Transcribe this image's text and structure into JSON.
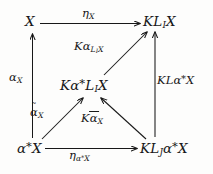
{
  "figure": {
    "kind": "commutative-diagram",
    "background_color": "#fdfdfc",
    "ink_color": "#181818"
  },
  "nodes": {
    "top_left": {
      "id": "X",
      "parts": [
        "X"
      ]
    },
    "top_right": {
      "id": "KL_I X",
      "parts": [
        "K",
        "L",
        "I",
        "X"
      ]
    },
    "center": {
      "id": "Ka*L_I X",
      "parts": [
        "K",
        "a",
        "*",
        "L",
        "I",
        "X"
      ]
    },
    "bottom_left": {
      "id": "a*X",
      "parts": [
        "a",
        "*",
        "X"
      ]
    },
    "bottom_right": {
      "id": "KL_J a*X",
      "parts": [
        "K",
        "L",
        "J",
        "a",
        "*",
        "X"
      ]
    }
  },
  "edge_labels": {
    "eta_x": {
      "base": "η",
      "sub": "X"
    },
    "k_alpha_lix": {
      "base": "Kα",
      "sub": "L",
      "subsub": "I",
      "subtail": "X"
    },
    "kl_alpha_x": {
      "base": "KLα",
      "star": "*",
      "tail": "X"
    },
    "alpha_x": {
      "base": "α",
      "sub": "X"
    },
    "alpha_tilde_x": {
      "base": "α",
      "accent": "~",
      "sub": "X"
    },
    "k_alpha_bar_x": {
      "base": "Kα",
      "accent": "bar",
      "sub": "X"
    },
    "eta_alpha_x": {
      "base": "η",
      "sub": "α",
      "substar": "*",
      "subtail": "X"
    }
  },
  "text": {
    "node_top_left": "X",
    "node_top_right_K": "K",
    "node_top_right_L": "L",
    "node_top_right_I": "I",
    "node_top_right_X": "X",
    "node_center_K": "K",
    "node_center_alpha": "α",
    "node_center_star": "*",
    "node_center_L": "L",
    "node_center_I": "I",
    "node_center_X": "X",
    "node_bottom_left_alpha": "α",
    "node_bottom_left_star": "*",
    "node_bottom_left_X": "X",
    "node_bottom_right_K": "K",
    "node_bottom_right_L": "L",
    "node_bottom_right_J": "J",
    "node_bottom_right_alpha": "α",
    "node_bottom_right_star": "*",
    "node_bottom_right_X": "X",
    "eta": "η",
    "eta_sub_X": "X",
    "K": "K",
    "alpha": "α",
    "sub_L": "L",
    "sub_I": "I",
    "sub_X": "X",
    "KL": "KL",
    "star": "*",
    "X": "X",
    "tilde": "˜",
    "eta_sub_alpha": "α",
    "bleed_top": "",
    "bleed_bottom": ""
  },
  "edges": [
    {
      "from": "top_left",
      "to": "top_right",
      "label": "eta_x",
      "direction": "right"
    },
    {
      "from": "bottom_left",
      "to": "top_left",
      "label": "alpha_x",
      "direction": "up"
    },
    {
      "from": "center",
      "to": "top_right",
      "label": "k_alpha_lix",
      "direction": "up-right"
    },
    {
      "from": "bottom_right",
      "to": "top_right",
      "label": "kl_alpha_x",
      "direction": "up"
    },
    {
      "from": "bottom_left",
      "to": "center",
      "label": "alpha_tilde_x",
      "direction": "up-right"
    },
    {
      "from": "bottom_right",
      "to": "center",
      "label": "k_alpha_bar_x",
      "direction": "up-left"
    },
    {
      "from": "bottom_left",
      "to": "bottom_right",
      "label": "eta_alpha_x",
      "direction": "right"
    }
  ]
}
